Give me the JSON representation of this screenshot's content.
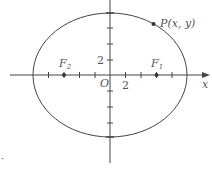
{
  "diagram": {
    "type": "ellipse-with-foci",
    "axes": {
      "x_label": "x",
      "origin_label": "O",
      "x_tick_label": "2",
      "y_tick_label": "2"
    },
    "ellipse": {
      "semi_major_units": 10,
      "semi_minor_units": 8
    },
    "foci": [
      {
        "label": "F",
        "sub": "1",
        "x_units": 6
      },
      {
        "label": "F",
        "sub": "2",
        "x_units": -6
      }
    ],
    "point": {
      "label": "P(x, y)"
    },
    "corner_mark": "."
  },
  "colors": {
    "stroke": "#444444",
    "text": "#555555"
  }
}
